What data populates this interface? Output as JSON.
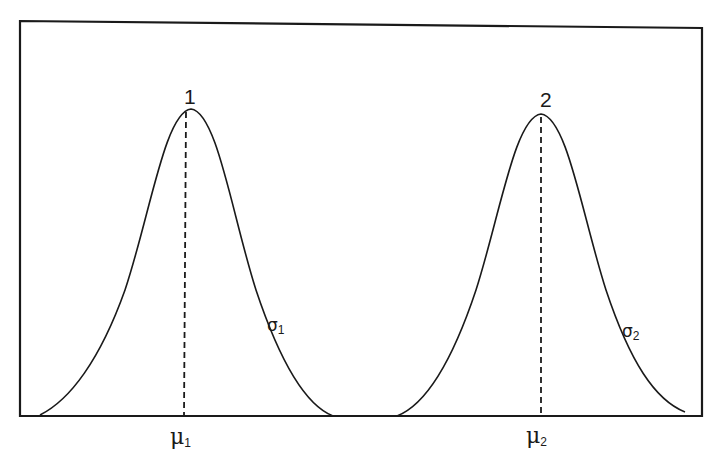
{
  "diagram": {
    "curves": [
      {
        "id": "1",
        "peak_label": "1",
        "mean_label": "μ",
        "mean_subscript": "1",
        "sigma_label": "σ",
        "sigma_subscript": "1"
      },
      {
        "id": "2",
        "peak_label": "2",
        "mean_label": "μ",
        "mean_subscript": "2",
        "sigma_label": "σ",
        "sigma_subscript": "2"
      }
    ],
    "colors": {
      "line": "#1a1a1a",
      "background": "#ffffff"
    }
  }
}
